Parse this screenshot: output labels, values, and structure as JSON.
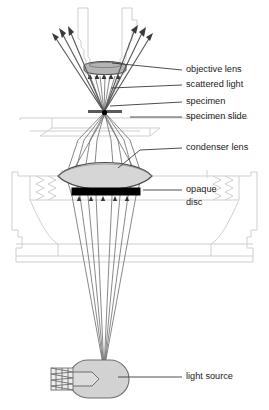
{
  "diagram": {
    "background_color": "#ffffff",
    "labels": [
      {
        "id": "objective-lens",
        "text": "objective lens",
        "x": 186,
        "y": 70,
        "leader": {
          "x1": 152,
          "y1": 70,
          "x2": 112,
          "y2": 63
        }
      },
      {
        "id": "scattered-light",
        "text": "scattered light",
        "x": 186,
        "y": 85,
        "leader": {
          "x1": 152,
          "y1": 85,
          "x2": 111,
          "y2": 88
        }
      },
      {
        "id": "specimen",
        "text": "specimen",
        "x": 186,
        "y": 102,
        "leader": {
          "x1": 152,
          "y1": 102,
          "x2": 110,
          "y2": 106
        }
      },
      {
        "id": "specimen-slide",
        "text": "specimen slide",
        "x": 186,
        "y": 117,
        "leader": {
          "x1": 152,
          "y1": 117,
          "x2": 130,
          "y2": 117
        }
      },
      {
        "id": "condenser-lens",
        "text": "condenser lens",
        "x": 186,
        "y": 148,
        "leader": {
          "x1": 152,
          "y1": 148,
          "x2": 118,
          "y2": 168
        }
      },
      {
        "id": "opaque-disc-1",
        "text": "opaque",
        "x": 186,
        "y": 190,
        "leader": {
          "x1": 152,
          "y1": 190,
          "x2": 143,
          "y2": 190
        }
      },
      {
        "id": "opaque-disc-2",
        "text": "disc",
        "x": 186,
        "y": 203,
        "leader": null
      },
      {
        "id": "light-source",
        "text": "light source",
        "x": 186,
        "y": 377,
        "leader": {
          "x1": 152,
          "y1": 377,
          "x2": 118,
          "y2": 377
        }
      }
    ],
    "components": {
      "objective_lens": {
        "name": "objective lens",
        "fill": "#b4b4b4",
        "stroke": "#4a4a4a"
      },
      "condenser_lens": {
        "name": "condenser lens",
        "fill": "#d6d6d6",
        "stroke": "#4a4a4a"
      },
      "opaque_disc": {
        "name": "opaque disc",
        "fill": "#000000",
        "stroke": "#000000"
      },
      "specimen": {
        "name": "specimen",
        "fill": "#000000",
        "stroke": "#000000"
      },
      "light_source": {
        "name": "light source bulb",
        "fill": "#d2d2d2",
        "stroke": "#6e6e6e"
      },
      "microscope_body": {
        "name": "microscope body outline",
        "fill": "none",
        "stroke": "#cfcfcf"
      },
      "light_rays": {
        "name": "light rays",
        "stroke": "#6b6b6b"
      },
      "scattered_rays": {
        "name": "scattered light rays",
        "stroke": "#555555"
      }
    }
  }
}
